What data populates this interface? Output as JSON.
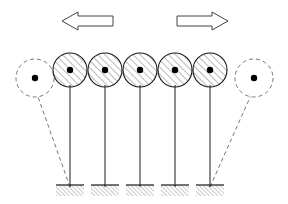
{
  "figure": {
    "canvas": {
      "width": 288,
      "height": 204
    },
    "background_color": "#ffffff",
    "stroke_color": "#1a1a1a",
    "hatch_color": "#555555",
    "ghost_color": "#777777",
    "bob_fill_color": "#ffffff",
    "pivot_dot_color": "#000000"
  },
  "arrows": [
    {
      "name": "left-arrow",
      "direction": "left",
      "label": "",
      "tip_x": 62,
      "tail_x": 113,
      "center_y": 21,
      "shaft_half_height": 5,
      "head_half_height": 9,
      "head_length": 16,
      "fill": "#ffffff",
      "stroke": "#444444"
    },
    {
      "name": "right-arrow",
      "direction": "right",
      "label": "",
      "tip_x": 228,
      "tail_x": 177,
      "center_y": 21,
      "shaft_half_height": 5,
      "head_half_height": 9,
      "head_length": 16,
      "fill": "#ffffff",
      "stroke": "#444444"
    }
  ],
  "pendulums": [
    {
      "name": "pendulum-1",
      "index": 1,
      "bob_cx": 70,
      "bob_cy": 70,
      "bob_r": 17,
      "base_cx": 70,
      "base_y": 187,
      "state": "upright"
    },
    {
      "name": "pendulum-2",
      "index": 2,
      "bob_cx": 105,
      "bob_cy": 70,
      "bob_r": 17,
      "base_cx": 105,
      "base_y": 187,
      "state": "upright"
    },
    {
      "name": "pendulum-3",
      "index": 3,
      "bob_cx": 140,
      "bob_cy": 70,
      "bob_r": 17,
      "base_cx": 140,
      "base_y": 187,
      "state": "upright"
    },
    {
      "name": "pendulum-4",
      "index": 4,
      "bob_cx": 175,
      "bob_cy": 70,
      "bob_r": 17,
      "base_cx": 175,
      "base_y": 187,
      "state": "upright"
    },
    {
      "name": "pendulum-5",
      "index": 5,
      "bob_cx": 210,
      "bob_cy": 70,
      "bob_r": 17,
      "base_cx": 210,
      "base_y": 187,
      "state": "upright"
    }
  ],
  "ghosts": [
    {
      "name": "ghost-pendulum-left",
      "side": "left",
      "bob_cx": 35,
      "bob_cy": 78,
      "bob_r": 19,
      "base_cx": 70,
      "base_y": 187,
      "state": "displaced",
      "style": "dashed"
    },
    {
      "name": "ghost-pendulum-right",
      "side": "right",
      "bob_cx": 254,
      "bob_cy": 78,
      "bob_r": 19,
      "base_cx": 210,
      "base_y": 187,
      "state": "displaced",
      "style": "dashed"
    }
  ],
  "ground_plates": [
    {
      "name": "ground-plate-1",
      "cx": 70,
      "top_y": 185,
      "width": 28,
      "height": 11
    },
    {
      "name": "ground-plate-2",
      "cx": 105,
      "top_y": 185,
      "width": 28,
      "height": 11
    },
    {
      "name": "ground-plate-3",
      "cx": 140,
      "top_y": 185,
      "width": 28,
      "height": 11
    },
    {
      "name": "ground-plate-4",
      "cx": 175,
      "top_y": 185,
      "width": 28,
      "height": 11
    },
    {
      "name": "ground-plate-5",
      "cx": 210,
      "top_y": 185,
      "width": 28,
      "height": 11
    }
  ],
  "hatching": {
    "bob_angle_deg": 45,
    "bob_spacing_px": 5,
    "ground_angle_deg": 45,
    "ground_spacing_px": 3
  }
}
